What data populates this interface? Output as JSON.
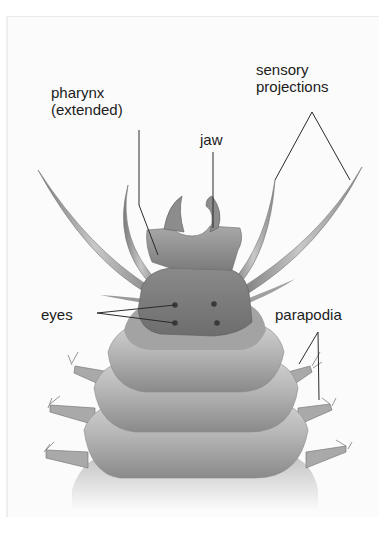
{
  "figure": {
    "colors": {
      "background": "#fbfbfb",
      "body_light": "#c4c4c4",
      "body_mid": "#9a9a9a",
      "body_dark": "#6e6e6e",
      "leader_line": "#2a2a2a",
      "label_text": "#1c1c1c"
    }
  },
  "labels": {
    "pharynx": {
      "line1": "pharynx",
      "line2": "(extended)"
    },
    "jaw": "jaw",
    "sensory": {
      "line1": "sensory",
      "line2": "projections"
    },
    "eyes": "eyes",
    "parapodia": "parapodia"
  }
}
